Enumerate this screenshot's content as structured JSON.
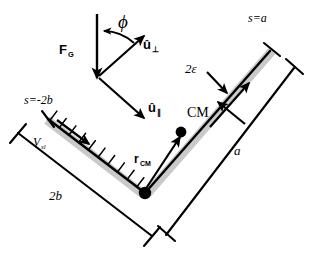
{
  "figure": {
    "background_color": "#ffffff",
    "stroke_color": "#000000",
    "band_color": "#cccccc"
  },
  "labels": {
    "phi": "ϕ",
    "force_gravity": "F",
    "force_gravity_sub": "G",
    "unit_perp": "û",
    "unit_perp_sub": "⊥",
    "unit_par": "û",
    "unit_par_sub": "∥",
    "center_of_mass": "CM",
    "r_cm": "r",
    "r_cm_sub": "CM",
    "s_equals_a": "s=a",
    "s_equals_minus_2b": "s=-2b",
    "two_epsilon": "2ε",
    "length_a": "a",
    "length_2b": "2b",
    "v_slide": "V",
    "v_slide_sub": "sl"
  },
  "geometry": {
    "vertex": {
      "x": 145,
      "y": 193
    },
    "right_tip": {
      "x": 271,
      "y": 50
    },
    "left_tip": {
      "x": 48,
      "y": 119
    },
    "cm_point": {
      "x": 181,
      "y": 132
    },
    "gravity_arrow": {
      "x1": 97,
      "y1": 15,
      "x2": 97,
      "y2": 77
    },
    "u_perp_arrow": {
      "x1": 99,
      "y1": 76,
      "x2": 143,
      "y2": 36
    },
    "u_par_arrow": {
      "x1": 99,
      "y1": 76,
      "x2": 143,
      "y2": 116
    }
  },
  "annotations": {
    "arm_right_label": "2ε",
    "hatch_count": 10,
    "bracket_style": "tee-ends"
  }
}
